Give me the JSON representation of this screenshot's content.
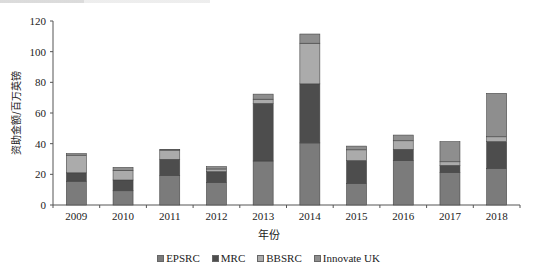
{
  "chart_data": {
    "type": "bar",
    "stacked": true,
    "title": "",
    "xlabel": "年份",
    "ylabel": "资助金额/百万英镑",
    "ylim": [
      0,
      120
    ],
    "yticks": [
      0,
      20,
      40,
      60,
      80,
      100,
      120
    ],
    "grid": false,
    "legend_position": "bottom",
    "categories": [
      "2009",
      "2010",
      "2011",
      "2012",
      "2013",
      "2014",
      "2015",
      "2016",
      "2017",
      "2018"
    ],
    "series": [
      {
        "name": "EPSRC",
        "color": "#7b7b7b",
        "values": [
          15.5,
          9.3,
          19.2,
          14.8,
          28.7,
          40.5,
          14.1,
          28.9,
          21.1,
          23.9
        ]
      },
      {
        "name": "MRC",
        "color": "#4d4d4d",
        "values": [
          5.5,
          7.0,
          10.6,
          6.9,
          37.5,
          38.5,
          14.8,
          7.4,
          4.7,
          17.4
        ]
      },
      {
        "name": "BBSRC",
        "color": "#ababab",
        "values": [
          11.5,
          6.3,
          6.0,
          1.8,
          2.8,
          26.5,
          7.1,
          5.6,
          2.4,
          3.2
        ]
      },
      {
        "name": "Innovate UK",
        "color": "#8e8e8e",
        "values": [
          1.0,
          1.9,
          0.5,
          1.5,
          3.3,
          6.0,
          2.4,
          3.7,
          13.1,
          28.3
        ]
      }
    ]
  }
}
